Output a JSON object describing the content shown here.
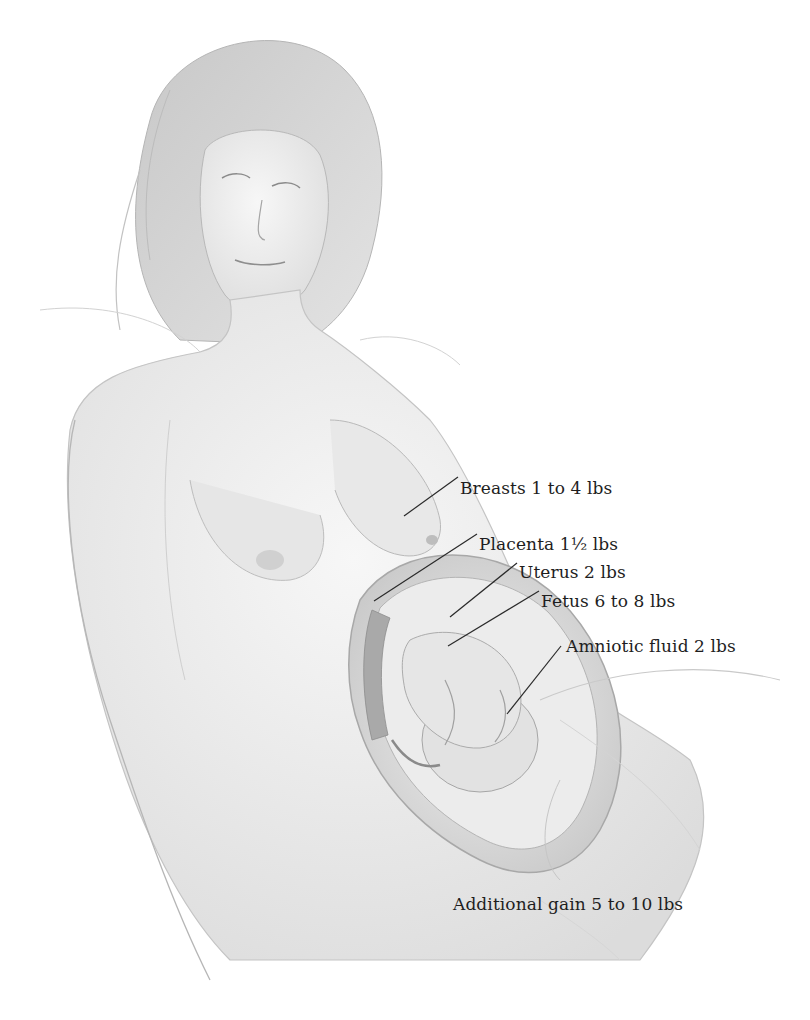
{
  "diagram": {
    "type": "anatomical-illustration",
    "style": "grayscale pencil drawing",
    "colors": {
      "background": "#ffffff",
      "text": "#1e1e1e",
      "leader_line": "#2a2a2a",
      "sketch": "#9a9a9a"
    },
    "labels": [
      {
        "id": "breasts",
        "text": "Breasts 1 to 4 lbs",
        "x": 460,
        "y": 480,
        "line": {
          "x1": 404,
          "y1": 516,
          "x2": 458,
          "y2": 477
        }
      },
      {
        "id": "placenta",
        "text": "Placenta 1½ lbs",
        "x": 479,
        "y": 537,
        "line": {
          "x1": 374,
          "y1": 601,
          "x2": 477,
          "y2": 534
        }
      },
      {
        "id": "uterus",
        "text": "Uterus 2 lbs",
        "x": 519,
        "y": 566,
        "line": {
          "x1": 450,
          "y1": 617,
          "x2": 517,
          "y2": 563
        }
      },
      {
        "id": "fetus",
        "text": "Fetus 6 to 8 lbs",
        "x": 541,
        "y": 594,
        "line": {
          "x1": 448,
          "y1": 646,
          "x2": 539,
          "y2": 591
        }
      },
      {
        "id": "amniotic-fluid",
        "text": "Amniotic fluid 2 lbs",
        "x": 566,
        "y": 639,
        "line": {
          "x1": 507,
          "y1": 714,
          "x2": 561,
          "y2": 646
        }
      },
      {
        "id": "additional-gain",
        "text": "Additional gain 5 to 10 lbs",
        "x": 453,
        "y": 897,
        "line": null
      }
    ]
  }
}
